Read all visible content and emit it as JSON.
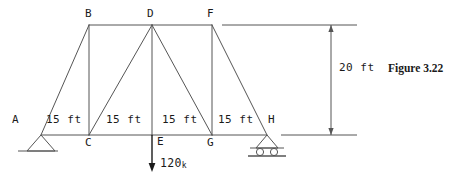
{
  "figure": {
    "caption": "Figure 3.22"
  },
  "diagram": {
    "type": "truss-free-body-diagram",
    "stroke_color": "#555555",
    "text_color": "#1a1a1a",
    "joints": [
      {
        "id": "A",
        "label": "A",
        "x": 41,
        "y": 135,
        "label_x": 12,
        "label_y": 114
      },
      {
        "id": "B",
        "label": "B",
        "x": 89,
        "y": 25,
        "label_x": 85,
        "label_y": 8
      },
      {
        "id": "C",
        "label": "C",
        "x": 89,
        "y": 135,
        "label_x": 85,
        "label_y": 137
      },
      {
        "id": "D",
        "label": "D",
        "x": 152,
        "y": 25,
        "label_x": 147,
        "label_y": 8
      },
      {
        "id": "E",
        "label": "E",
        "x": 152,
        "y": 135,
        "label_x": 157,
        "label_y": 136
      },
      {
        "id": "F",
        "label": "F",
        "x": 212,
        "y": 25,
        "label_x": 207,
        "label_y": 8
      },
      {
        "id": "G",
        "label": "G",
        "x": 212,
        "y": 135,
        "label_x": 207,
        "label_y": 137
      },
      {
        "id": "H",
        "label": "H",
        "x": 267,
        "y": 135,
        "label_x": 268,
        "label_y": 114
      }
    ],
    "members": [
      {
        "from": "A",
        "to": "B"
      },
      {
        "from": "B",
        "to": "D"
      },
      {
        "from": "D",
        "to": "F"
      },
      {
        "from": "A",
        "to": "C"
      },
      {
        "from": "C",
        "to": "E"
      },
      {
        "from": "E",
        "to": "G"
      },
      {
        "from": "G",
        "to": "H"
      },
      {
        "from": "B",
        "to": "C"
      },
      {
        "from": "D",
        "to": "E"
      },
      {
        "from": "F",
        "to": "G"
      },
      {
        "from": "C",
        "to": "D"
      },
      {
        "from": "D",
        "to": "G"
      },
      {
        "from": "F",
        "to": "H"
      }
    ],
    "panel_dimensions": [
      {
        "label": "15 ft",
        "x": 46,
        "y": 114
      },
      {
        "label": "15 ft",
        "x": 106,
        "y": 114
      },
      {
        "label": "15 ft",
        "x": 162,
        "y": 114
      },
      {
        "label": "15 ft",
        "x": 218,
        "y": 114
      }
    ],
    "height_dimension": {
      "label": "20 ft",
      "label_x": 339,
      "label_y": 62,
      "line_x": 331,
      "top_y": 25,
      "bottom_y": 135
    },
    "extension_lines": [
      {
        "x1": 222,
        "y1": 25,
        "x2": 357,
        "y2": 25
      },
      {
        "x1": 281,
        "y1": 135,
        "x2": 357,
        "y2": 135
      }
    ],
    "load": {
      "magnitude": "120",
      "unit": "k",
      "at_joint": "E",
      "label_x": 160,
      "label_y": 158,
      "arrow_x": 152,
      "arrow_y1": 135,
      "arrow_y2": 172
    },
    "supports": [
      {
        "type": "pin",
        "at_joint": "A",
        "x": 41,
        "y": 135
      },
      {
        "type": "roller",
        "at_joint": "H",
        "x": 267,
        "y": 135
      }
    ]
  }
}
